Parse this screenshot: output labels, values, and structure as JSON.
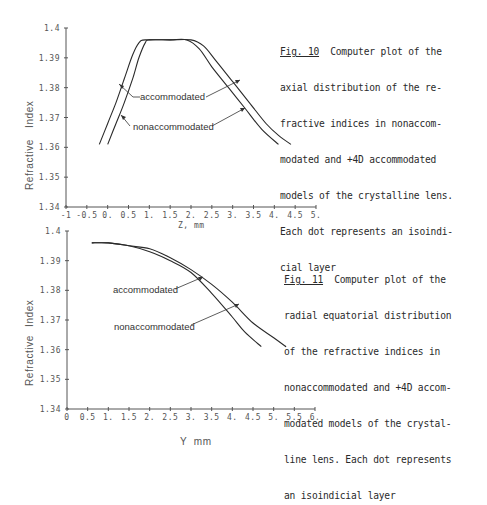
{
  "figures": [
    {
      "id": "fig10",
      "caption": {
        "ref": "Fig. 10",
        "lines": [
          "  Computer plot of the",
          "axial distribution of the re-",
          "fractive indices in nonaccom-",
          "modated and +4D accommodated",
          "models of the crystalline lens.",
          "Each dot represents an isoindi-",
          "cial layer"
        ]
      },
      "axes": {
        "ylabel_left": "Refractive",
        "ylabel_right": "Index",
        "xlabel": "Z, mm",
        "yticks": [
          "1.4",
          "1.39",
          "1.38",
          "1.37",
          "1.36",
          "1.35",
          "1.34"
        ],
        "xticks": [
          "-1",
          "-0.5",
          "0.",
          "0.5",
          "1.",
          "1.5",
          "2.",
          "2.5",
          "3.",
          "3.5",
          "4.",
          "4.5",
          "5."
        ]
      },
      "labels": {
        "accommodated": "accommodated",
        "nonaccommodated": "nonaccommodated"
      }
    },
    {
      "id": "fig11",
      "caption": {
        "ref": "Fig. 11",
        "lines": [
          "  Computer plot of the",
          "radial equatorial distribution",
          "of the refractive indices in",
          "nonaccommodated and +4D accom-",
          "modated models of the crystal-",
          "line lens. Each dot represents",
          "an isoindicial layer"
        ]
      },
      "axes": {
        "ylabel_left": "Refractive",
        "ylabel_right": "Index",
        "xlabel": "Y  mm",
        "yticks": [
          "1.4",
          "1.39",
          "1.38",
          "1.37",
          "1.36",
          "1.35",
          "1.34"
        ],
        "xticks": [
          "0",
          "0.5",
          "1.",
          "1.5",
          "2.",
          "2.5",
          "3.",
          "3.5",
          "4.",
          "4.5",
          "5.",
          "5.5",
          "6."
        ]
      },
      "labels": {
        "accommodated": "accommodated",
        "nonaccommodated": "nonaccommodated"
      }
    }
  ],
  "chart_data": [
    {
      "type": "line",
      "title": "Fig. 10 Computer plot of the axial distribution of the refractive indices in nonaccommodated and +4D accommodated models of the crystalline lens",
      "xlabel": "Z, mm",
      "ylabel": "Refractive Index",
      "xlim": [
        -1,
        5
      ],
      "ylim": [
        1.34,
        1.4
      ],
      "xticks": [
        -1,
        -0.5,
        0,
        0.5,
        1,
        1.5,
        2,
        2.5,
        3,
        3.5,
        4,
        4.5,
        5
      ],
      "yticks": [
        1.34,
        1.35,
        1.36,
        1.37,
        1.38,
        1.39,
        1.4
      ],
      "grid": false,
      "series": [
        {
          "name": "accommodated",
          "x": [
            -0.2,
            0.0,
            0.2,
            0.4,
            0.6,
            0.75,
            0.9,
            1.5,
            2.0,
            2.3,
            2.6,
            3.0,
            3.4,
            3.8,
            4.1,
            4.4
          ],
          "y": [
            1.361,
            1.368,
            1.375,
            1.383,
            1.391,
            1.395,
            1.396,
            1.396,
            1.396,
            1.394,
            1.389,
            1.382,
            1.375,
            1.368,
            1.364,
            1.361
          ]
        },
        {
          "name": "nonaccommodated",
          "x": [
            0.0,
            0.2,
            0.4,
            0.6,
            0.75,
            0.9,
            1.0,
            1.5,
            1.9,
            2.2,
            2.5,
            2.9,
            3.3,
            3.7,
            4.1
          ],
          "y": [
            1.361,
            1.368,
            1.375,
            1.383,
            1.39,
            1.395,
            1.396,
            1.396,
            1.396,
            1.393,
            1.387,
            1.38,
            1.373,
            1.366,
            1.361
          ]
        }
      ]
    },
    {
      "type": "line",
      "title": "Fig. 11 Computer plot of the radial equatorial distribution of the refractive indices in nonaccommodated and +4D accommodated models of the crystalline lens",
      "xlabel": "Y mm",
      "ylabel": "Refractive Index",
      "xlim": [
        0,
        6
      ],
      "ylim": [
        1.34,
        1.4
      ],
      "xticks": [
        0,
        0.5,
        1,
        1.5,
        2,
        2.5,
        3,
        3.5,
        4,
        4.5,
        5,
        5.5,
        6
      ],
      "yticks": [
        1.34,
        1.35,
        1.36,
        1.37,
        1.38,
        1.39,
        1.4
      ],
      "grid": false,
      "series": [
        {
          "name": "accommodated",
          "x": [
            0.6,
            1.0,
            1.5,
            2.0,
            2.5,
            3.0,
            3.5,
            4.0,
            4.3,
            4.7
          ],
          "y": [
            1.396,
            1.396,
            1.395,
            1.393,
            1.39,
            1.386,
            1.379,
            1.371,
            1.366,
            1.361
          ]
        },
        {
          "name": "nonaccommodated",
          "x": [
            0.6,
            1.0,
            1.5,
            2.0,
            2.5,
            3.0,
            3.5,
            4.0,
            4.5,
            5.0,
            5.3
          ],
          "y": [
            1.396,
            1.396,
            1.395,
            1.394,
            1.391,
            1.387,
            1.382,
            1.376,
            1.369,
            1.364,
            1.361
          ]
        }
      ]
    }
  ]
}
